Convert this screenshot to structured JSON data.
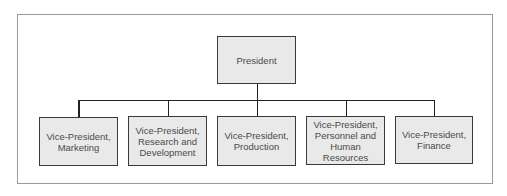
{
  "diagram": {
    "type": "org-chart",
    "root": {
      "id": "president",
      "label": "President"
    },
    "children": [
      {
        "id": "vp-marketing",
        "label": "Vice-President, Marketing"
      },
      {
        "id": "vp-rnd",
        "label": "Vice-President, Research and Development"
      },
      {
        "id": "vp-production",
        "label": "Vice-President, Production"
      },
      {
        "id": "vp-personnel",
        "label": "Vice-President, Personnel and Human Resources"
      },
      {
        "id": "vp-finance",
        "label": "Vice-President, Finance"
      }
    ],
    "colors": {
      "box_fill": "#e9e9e9",
      "box_border": "#3a3a3a",
      "connector": "#222222",
      "text": "#4a4a4a",
      "frame": "#9a9a9a"
    }
  }
}
